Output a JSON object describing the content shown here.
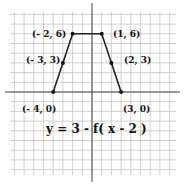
{
  "equation": "y = 3 - f( x - 2 )",
  "points": [
    {
      "label": "(- 4, 0)",
      "x": -4,
      "y": 0
    },
    {
      "label": "(- 3, 3)",
      "x": -3,
      "y": 3
    },
    {
      "label": "(- 2, 6)",
      "x": -2,
      "y": 6
    },
    {
      "label": "(1, 6)",
      "x": 1,
      "y": 6
    },
    {
      "label": "(2, 3)",
      "x": 2,
      "y": 3
    },
    {
      "label": "(3, 0)",
      "x": 3,
      "y": 0
    }
  ],
  "grid": {
    "xmin": -9,
    "xmax": 9,
    "ymin": -8,
    "ymax": 8
  },
  "colors": {
    "grid": "#bdbdbd",
    "axis": "#444444",
    "line": "#222222"
  }
}
